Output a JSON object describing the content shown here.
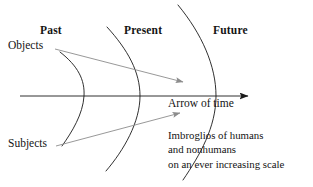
{
  "figure": {
    "type": "diagram",
    "background_color": "#ffffff",
    "line_color": "#1a1a1a",
    "accent_color": "#8c8c8c"
  },
  "epoch_labels": {
    "past": "Past",
    "present": "Present",
    "future": "Future"
  },
  "side_labels": {
    "objects": "Objects",
    "subjects": "Subjects"
  },
  "axis": {
    "label": "Arrow of time",
    "direction": "left-to-right"
  },
  "annotation": {
    "line1": "Imbroglios of humans",
    "line2": "and nonhumans",
    "line3": "on an ever increasing scale"
  },
  "elements": {
    "curve_past_name": "past-boundary-curve",
    "curve_present_name": "present-boundary-curve",
    "curve_future_name": "future-boundary-curve",
    "objects_arrow_name": "objects-divergence-arrow",
    "subjects_arrow_name": "subjects-divergence-arrow",
    "time_arrow_name": "arrow-of-time"
  }
}
